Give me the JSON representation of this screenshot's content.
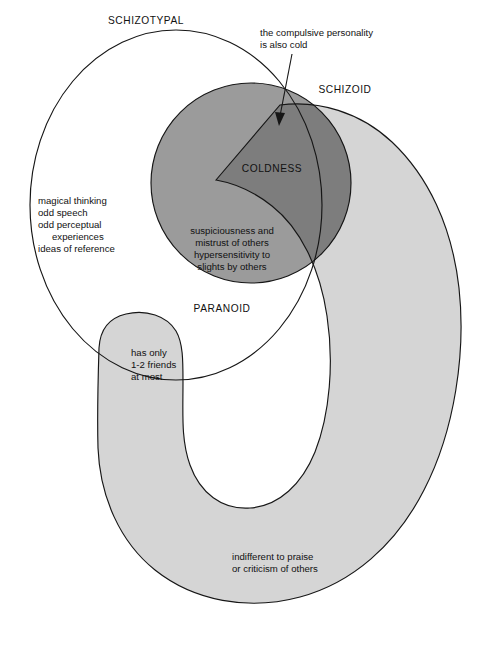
{
  "diagram": {
    "regions": {
      "schizotypal": {
        "label": "SCHIZOTYPAL",
        "fill": "#ffffff",
        "stroke": "#161616",
        "features": [
          "magical thinking",
          "odd speech",
          "odd perceptual",
          "experiences",
          "ideas of reference"
        ]
      },
      "schizoid": {
        "label": "SCHIZOID",
        "fill": "#d5d5d5",
        "stroke": "#161616",
        "features": [
          "has only",
          "1-2 friends",
          "at most",
          "indifferent to praise",
          "or criticism of others"
        ]
      },
      "paranoid": {
        "label": "PARANOID",
        "fill": "#9b9b9b",
        "stroke": "#161616",
        "features": [
          "suspiciousness and",
          "mistrust of others",
          "hypersensitivity to",
          "slights by others"
        ]
      },
      "intersection": {
        "label": "COLDNESS",
        "fill": "#808080",
        "stroke": "#161616"
      }
    },
    "callout": {
      "line1": "the compulsive personality",
      "line2": "is also cold"
    },
    "text_blocks": {
      "schizotypal_features": {
        "line1": "magical thinking",
        "line2": "odd speech",
        "line3": "odd perceptual",
        "line4": "experiences",
        "line5": "ideas of reference"
      },
      "paranoid_features": {
        "line1": "suspiciousness and",
        "line2": "mistrust of others",
        "line3": "hypersensitivity to",
        "line4": "slights by others"
      },
      "schizoid_friends": {
        "line1": "has only",
        "line2": "1-2 friends",
        "line3": "at most"
      },
      "schizoid_indifferent": {
        "line1": "indifferent to praise",
        "line2": "or criticism of others"
      }
    }
  }
}
